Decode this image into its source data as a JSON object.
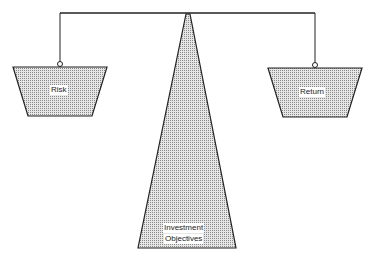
{
  "diagram": {
    "type": "balance-scale",
    "left_pan": {
      "label": "Risk"
    },
    "right_pan": {
      "label": "Return"
    },
    "fulcrum": {
      "label_line1": "Investment",
      "label_line2": "Objectives"
    }
  },
  "colors": {
    "line": "#222222",
    "fill": "#c8c8c8",
    "background": "#ffffff"
  }
}
